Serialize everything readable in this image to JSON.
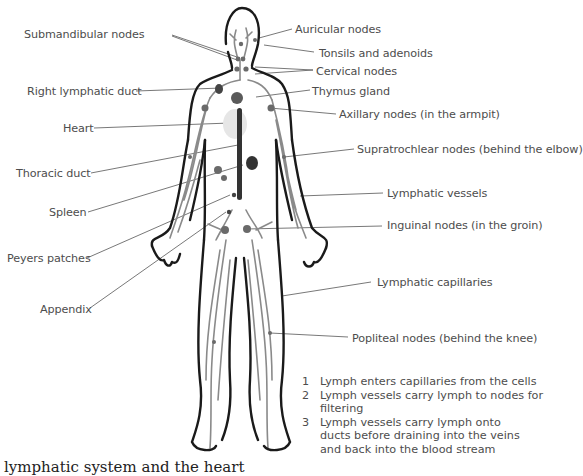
{
  "figure": {
    "labels_left": [
      {
        "id": "submandibular",
        "text": "Submandibular nodes",
        "x": 24,
        "y": 28
      },
      {
        "id": "right-lymphatic-duct",
        "text": "Right lymphatic duct",
        "x": 27,
        "y": 85
      },
      {
        "id": "heart",
        "text": "Heart",
        "x": 63,
        "y": 122
      },
      {
        "id": "thoracic-duct",
        "text": "Thoracic duct",
        "x": 16,
        "y": 167
      },
      {
        "id": "spleen",
        "text": "Spleen",
        "x": 49,
        "y": 206
      },
      {
        "id": "peyers-patches",
        "text": "Peyers patches",
        "x": 7,
        "y": 252
      },
      {
        "id": "appendix",
        "text": "Appendix",
        "x": 40,
        "y": 303
      }
    ],
    "labels_right": [
      {
        "id": "auricular",
        "text": "Auricular nodes",
        "x": 295,
        "y": 23
      },
      {
        "id": "tonsils",
        "text": "Tonsils and adenoids",
        "x": 319,
        "y": 47
      },
      {
        "id": "cervical",
        "text": "Cervical nodes",
        "x": 316,
        "y": 65
      },
      {
        "id": "thymus",
        "text": "Thymus gland",
        "x": 312,
        "y": 85
      },
      {
        "id": "axillary",
        "text": "Axillary nodes (in the armpit)",
        "x": 339,
        "y": 108
      },
      {
        "id": "supratrochlear",
        "text": "Supratrochlear nodes (behind the elbow)",
        "x": 357,
        "y": 143
      },
      {
        "id": "lymphatic-vessels",
        "text": "Lymphatic vessels",
        "x": 387,
        "y": 187
      },
      {
        "id": "inguinal",
        "text": "Inguinal nodes (in the groin)",
        "x": 387,
        "y": 219
      },
      {
        "id": "lymphatic-capillaries",
        "text": "Lymphatic capillaries",
        "x": 377,
        "y": 276
      },
      {
        "id": "popliteal",
        "text": "Popliteal nodes (behind the knee)",
        "x": 352,
        "y": 332
      }
    ],
    "steps": [
      {
        "num": "1",
        "text": "Lymph enters capillaries from the cells"
      },
      {
        "num": "2",
        "text": "Lymph vessels carry lymph to nodes for filtering"
      },
      {
        "num": "3",
        "text": "Lymph vessels carry lymph onto ducts before draining into the veins and back into the blood stream"
      }
    ],
    "caption_clipped": "lymphatic system and the heart",
    "colors": {
      "outline": "#1a1a1a",
      "vessel": "#8a8a8a",
      "node": "#5a5a5a",
      "duct": "#333333",
      "heart": "#e6e6e6",
      "leader": "#555555",
      "text": "#4d4d4d"
    }
  }
}
